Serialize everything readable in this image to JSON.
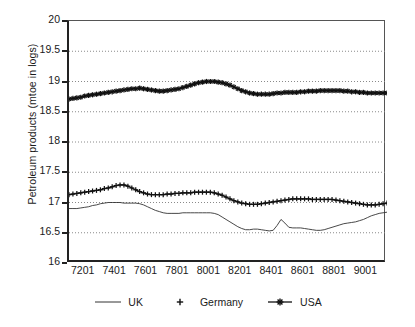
{
  "chart_data": {
    "type": "line",
    "title": "",
    "xlabel": "",
    "ylabel": "Petroleum products (mtoe in logs)",
    "ylim": [
      16,
      20
    ],
    "yticks": [
      "16",
      "16.5",
      "17",
      "17.5",
      "18",
      "18.5",
      "19",
      "19.5",
      "20"
    ],
    "ytick_values": [
      16,
      16.5,
      17,
      17.5,
      18,
      18.5,
      19,
      19.5,
      20
    ],
    "xticks": [
      "7201",
      "7401",
      "7601",
      "7801",
      "8001",
      "8201",
      "8401",
      "8601",
      "8801",
      "9001"
    ],
    "xtick_values": [
      1972.0,
      1974.0,
      1976.0,
      1978.0,
      1980.0,
      1982.0,
      1984.0,
      1986.0,
      1988.0,
      1990.0
    ],
    "xlim": [
      1971.0,
      1991.25
    ],
    "grid": "horizontal-dotted",
    "minor_ticks": "quarterly on x-axis",
    "legend": {
      "position": "bottom-center",
      "entries": [
        {
          "label": "UK",
          "marker": "none",
          "line": "solid-thin",
          "color": "#222222"
        },
        {
          "label": "Germany",
          "marker": "plus",
          "line": "solid",
          "color": "#111111"
        },
        {
          "label": "USA",
          "marker": "asterisk",
          "line": "solid",
          "color": "#111111"
        }
      ]
    },
    "x": [
      1971.0,
      1971.25,
      1971.5,
      1971.75,
      1972.0,
      1972.25,
      1972.5,
      1972.75,
      1973.0,
      1973.25,
      1973.5,
      1973.75,
      1974.0,
      1974.25,
      1974.5,
      1974.75,
      1975.0,
      1975.25,
      1975.5,
      1975.75,
      1976.0,
      1976.25,
      1976.5,
      1976.75,
      1977.0,
      1977.25,
      1977.5,
      1977.75,
      1978.0,
      1978.25,
      1978.5,
      1978.75,
      1979.0,
      1979.25,
      1979.5,
      1979.75,
      1980.0,
      1980.25,
      1980.5,
      1980.75,
      1981.0,
      1981.25,
      1981.5,
      1981.75,
      1982.0,
      1982.25,
      1982.5,
      1982.75,
      1983.0,
      1983.25,
      1983.5,
      1983.75,
      1984.0,
      1984.25,
      1984.5,
      1984.75,
      1985.0,
      1985.25,
      1985.5,
      1985.75,
      1986.0,
      1986.25,
      1986.5,
      1986.75,
      1987.0,
      1987.25,
      1987.5,
      1987.75,
      1988.0,
      1988.25,
      1988.5,
      1988.75,
      1989.0,
      1989.25,
      1989.5,
      1989.75,
      1990.0,
      1990.25,
      1990.5,
      1990.75,
      1991.0,
      1991.25
    ],
    "series": [
      {
        "name": "UK",
        "marker": "none",
        "values": [
          16.9,
          16.9,
          16.9,
          16.91,
          16.92,
          16.93,
          16.95,
          16.96,
          16.98,
          16.99,
          17.0,
          17.0,
          17.0,
          17.0,
          16.99,
          16.99,
          16.99,
          16.99,
          16.98,
          16.96,
          16.93,
          16.9,
          16.87,
          16.85,
          16.83,
          16.82,
          16.82,
          16.82,
          16.82,
          16.83,
          16.83,
          16.83,
          16.83,
          16.83,
          16.83,
          16.83,
          16.83,
          16.82,
          16.8,
          16.76,
          16.72,
          16.68,
          16.64,
          16.6,
          16.57,
          16.55,
          16.55,
          16.56,
          16.56,
          16.55,
          16.54,
          16.53,
          16.54,
          16.62,
          16.72,
          16.66,
          16.59,
          16.58,
          16.58,
          16.58,
          16.57,
          16.56,
          16.55,
          16.54,
          16.54,
          16.55,
          16.57,
          16.59,
          16.61,
          16.63,
          16.65,
          16.66,
          16.67,
          16.68,
          16.7,
          16.72,
          16.75,
          16.78,
          16.8,
          16.82,
          16.83,
          16.84
        ]
      },
      {
        "name": "Germany",
        "marker": "plus",
        "values": [
          17.13,
          17.14,
          17.15,
          17.16,
          17.17,
          17.18,
          17.19,
          17.2,
          17.21,
          17.23,
          17.24,
          17.26,
          17.28,
          17.29,
          17.29,
          17.27,
          17.24,
          17.21,
          17.18,
          17.16,
          17.14,
          17.13,
          17.13,
          17.13,
          17.13,
          17.14,
          17.14,
          17.15,
          17.15,
          17.16,
          17.16,
          17.16,
          17.17,
          17.17,
          17.17,
          17.17,
          17.17,
          17.16,
          17.14,
          17.12,
          17.09,
          17.06,
          17.03,
          17.01,
          16.99,
          16.98,
          16.97,
          16.97,
          16.97,
          16.98,
          16.99,
          17.0,
          17.01,
          17.02,
          17.03,
          17.04,
          17.05,
          17.06,
          17.06,
          17.06,
          17.06,
          17.06,
          17.05,
          17.05,
          17.05,
          17.05,
          17.05,
          17.05,
          17.04,
          17.03,
          17.02,
          17.01,
          17.0,
          16.99,
          16.98,
          16.97,
          16.96,
          16.96,
          16.96,
          16.97,
          16.98,
          16.99
        ]
      },
      {
        "name": "USA",
        "marker": "asterisk",
        "values": [
          18.71,
          18.72,
          18.73,
          18.74,
          18.76,
          18.77,
          18.78,
          18.79,
          18.8,
          18.81,
          18.82,
          18.83,
          18.84,
          18.85,
          18.86,
          18.87,
          18.88,
          18.88,
          18.89,
          18.88,
          18.87,
          18.86,
          18.85,
          18.84,
          18.84,
          18.85,
          18.86,
          18.87,
          18.88,
          18.9,
          18.92,
          18.94,
          18.96,
          18.98,
          18.99,
          19.0,
          19.0,
          19.0,
          18.99,
          18.98,
          18.96,
          18.94,
          18.91,
          18.88,
          18.85,
          18.83,
          18.81,
          18.8,
          18.79,
          18.79,
          18.79,
          18.79,
          18.8,
          18.81,
          18.81,
          18.82,
          18.82,
          18.82,
          18.82,
          18.83,
          18.83,
          18.84,
          18.84,
          18.84,
          18.85,
          18.85,
          18.85,
          18.85,
          18.85,
          18.85,
          18.84,
          18.84,
          18.83,
          18.83,
          18.82,
          18.82,
          18.81,
          18.81,
          18.81,
          18.81,
          18.81,
          18.81
        ]
      }
    ]
  }
}
